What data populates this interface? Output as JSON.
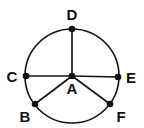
{
  "diagram": {
    "type": "circle-graph",
    "circle": {
      "cx": 72,
      "cy": 76,
      "r": 47
    },
    "colors": {
      "stroke": "#111111",
      "background": "#ffffff"
    },
    "points": [
      {
        "id": "A",
        "label": "A",
        "x": 72,
        "y": 76,
        "lx": 72,
        "ly": 94
      },
      {
        "id": "B",
        "label": "B",
        "x": 35,
        "y": 104,
        "lx": 25,
        "ly": 122
      },
      {
        "id": "C",
        "label": "C",
        "x": 26,
        "y": 76,
        "lx": 12,
        "ly": 82
      },
      {
        "id": "D",
        "label": "D",
        "x": 72,
        "y": 29,
        "lx": 72,
        "ly": 20
      },
      {
        "id": "E",
        "label": "E",
        "x": 118,
        "y": 77,
        "lx": 131,
        "ly": 83
      },
      {
        "id": "F",
        "label": "F",
        "x": 110,
        "y": 104,
        "lx": 121,
        "ly": 122
      }
    ],
    "segments": [
      [
        "A",
        "D"
      ],
      [
        "A",
        "C"
      ],
      [
        "A",
        "E"
      ],
      [
        "A",
        "B"
      ],
      [
        "A",
        "F"
      ]
    ]
  }
}
